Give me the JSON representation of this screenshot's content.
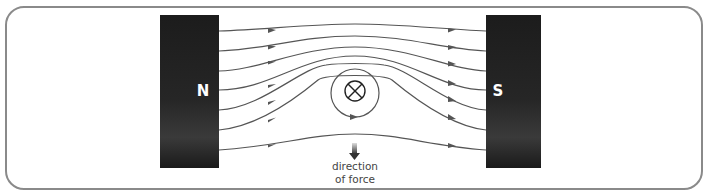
{
  "diagram": {
    "magnets": {
      "north": {
        "label": "N",
        "color": "#1e1e1e"
      },
      "south": {
        "label": "S",
        "color": "#1e1e1e"
      }
    },
    "conductor": {
      "symbol": "⊗",
      "current_direction": "into page"
    },
    "force": {
      "caption_line1": "direction",
      "caption_line2": "of force",
      "arrow_direction": "down"
    },
    "colors": {
      "frame": "#808080",
      "field_lines": "#555555",
      "magnet": "#1e1e1e",
      "text": "#444444"
    }
  }
}
